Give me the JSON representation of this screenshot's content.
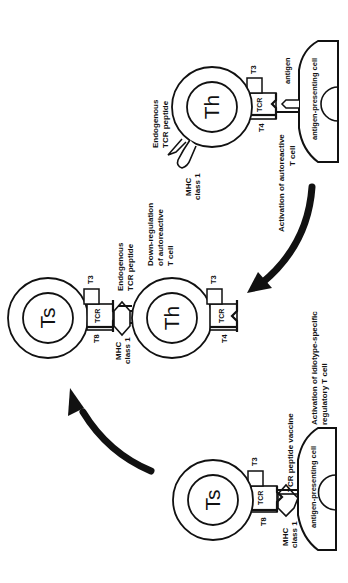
{
  "diagram": {
    "type": "immunology-mechanism",
    "orientation": "rotated-90-clockwise",
    "colors": {
      "stroke": "#111111",
      "background": "#ffffff"
    },
    "stages": [
      {
        "id": "stage1",
        "cell": {
          "name": "Th"
        },
        "apc_label": "antigen-presenting cell",
        "labels": {
          "antigen": "antigen",
          "t3": "T3",
          "t4": "T4",
          "tcr": "TCR",
          "endogenous_1": "Endogenous",
          "endogenous_2": "TCR peptide",
          "mhc_1": "MHC",
          "mhc_2": "class 1"
        },
        "caption_1": "Activation of autoreactive",
        "caption_2": "T cell"
      },
      {
        "id": "stage2",
        "cells": [
          {
            "name": "Th"
          },
          {
            "name": "Ts"
          }
        ],
        "labels": {
          "th_t3": "T3",
          "th_t4": "T4",
          "th_tcr": "TCR",
          "ts_t3": "T3",
          "ts_t8": "T8",
          "ts_tcr": "TCR",
          "endogenous_1": "Endogenous",
          "endogenous_2": "TCR peptide",
          "mhc_1": "MHC",
          "mhc_2": "class 1"
        },
        "caption_1": "Down-regulation",
        "caption_2": "of autoreactive",
        "caption_3": "T cell"
      },
      {
        "id": "stage3",
        "cell": {
          "name": "Ts"
        },
        "apc_label": "antigen-presenting cell",
        "labels": {
          "t3": "T3",
          "t8": "T8",
          "tcr": "TCR",
          "vaccine": "TCR peptide vaccine",
          "mhc_1": "MHC",
          "mhc_2": "class 1"
        },
        "caption_1": "Activation of idiotype-specific",
        "caption_2": "regulatory T cell"
      }
    ],
    "arrows": [
      {
        "from": "stage1",
        "to": "stage2"
      },
      {
        "from": "stage3",
        "to": "stage2"
      }
    ]
  }
}
